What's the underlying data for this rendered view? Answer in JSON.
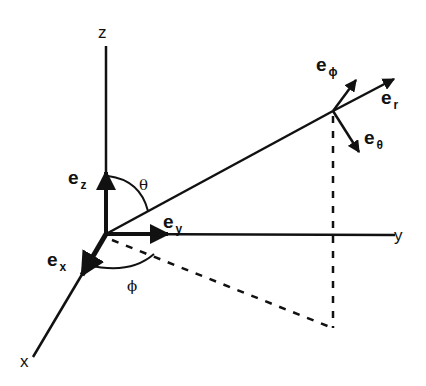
{
  "diagram": {
    "stroke_color": "#111111",
    "background": "#ffffff",
    "axes": {
      "x": {
        "label": "x"
      },
      "y": {
        "label": "y"
      },
      "z": {
        "label": "z"
      }
    },
    "cartesian_unit_vectors": [
      {
        "base": "e",
        "sub": "x"
      },
      {
        "base": "e",
        "sub": "y"
      },
      {
        "base": "e",
        "sub": "z"
      }
    ],
    "spherical_unit_vectors": [
      {
        "base": "e",
        "sub": "r"
      },
      {
        "base": "e",
        "sub": "θ"
      },
      {
        "base": "e",
        "sub": "ϕ"
      }
    ],
    "angles": {
      "theta": "θ",
      "phi": "ϕ"
    }
  }
}
